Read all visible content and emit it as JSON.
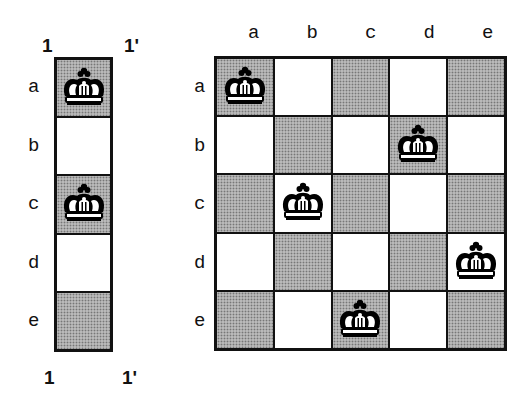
{
  "left_column": {
    "top_labels": [
      "1",
      "1'"
    ],
    "bottom_labels": [
      "1",
      "1'"
    ],
    "row_labels": [
      "a",
      "b",
      "c",
      "d",
      "e"
    ],
    "cells": [
      {
        "row": "a",
        "shade": "dark",
        "piece": "king"
      },
      {
        "row": "b",
        "shade": "light",
        "piece": ""
      },
      {
        "row": "c",
        "shade": "dark",
        "piece": "king"
      },
      {
        "row": "d",
        "shade": "light",
        "piece": ""
      },
      {
        "row": "e",
        "shade": "dark",
        "piece": ""
      }
    ]
  },
  "board": {
    "col_labels": [
      "a",
      "b",
      "c",
      "d",
      "e"
    ],
    "row_labels": [
      "a",
      "b",
      "c",
      "d",
      "e"
    ],
    "kings": [
      {
        "row": "a",
        "col": "a"
      },
      {
        "row": "b",
        "col": "d"
      },
      {
        "row": "c",
        "col": "b"
      },
      {
        "row": "d",
        "col": "e"
      },
      {
        "row": "e",
        "col": "c"
      }
    ]
  },
  "colors": {
    "dark_square": "#b9b9b9",
    "light_square": "#ffffff",
    "border": "#111111"
  }
}
